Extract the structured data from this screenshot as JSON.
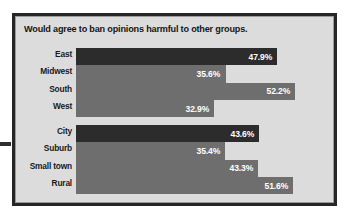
{
  "chart_data": {
    "type": "bar",
    "orientation": "horizontal",
    "title": "Would agree to ban opinions harmful to other groups.",
    "xlabel": "",
    "ylabel": "",
    "xlim": [
      0,
      60
    ],
    "grid": false,
    "legend": "none",
    "value_suffix": "%",
    "groups": [
      {
        "name": "region",
        "categories": [
          "East",
          "Midwest",
          "South",
          "West"
        ],
        "values": [
          47.9,
          35.6,
          52.2,
          32.9
        ],
        "value_labels": [
          "47.9%",
          "35.6%",
          "52.2%",
          "32.9%"
        ],
        "bar_colors": [
          "#2c2c2c",
          "#6e6e6e",
          "#6e6e6e",
          "#6e6e6e"
        ]
      },
      {
        "name": "community",
        "categories": [
          "City",
          "Suburb",
          "Small town",
          "Rural"
        ],
        "values": [
          43.6,
          35.4,
          43.3,
          51.6
        ],
        "value_labels": [
          "43.6%",
          "35.4%",
          "43.3%",
          "51.6%"
        ],
        "bar_colors": [
          "#2c2c2c",
          "#6e6e6e",
          "#6e6e6e",
          "#6e6e6e"
        ]
      }
    ]
  },
  "colors": {
    "panel_background": "#dcdcdc",
    "frame_border": "#262626",
    "bar_dark": "#2c2c2c",
    "bar_gray": "#6e6e6e",
    "value_text": "#ffffff",
    "label_text": "#1a1a1a"
  }
}
